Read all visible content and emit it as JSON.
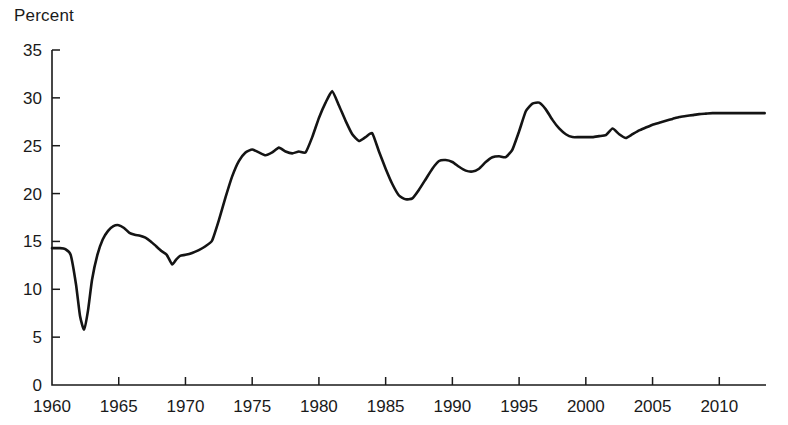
{
  "chart_data": {
    "type": "line",
    "title": "",
    "subtitle": "",
    "xlabel": "",
    "ylabel": "Percent",
    "ylim": [
      0,
      35
    ],
    "xlim": [
      1960,
      2013.5
    ],
    "yticks": [
      0,
      5,
      10,
      15,
      20,
      25,
      30,
      35
    ],
    "ytick_labels": [
      "0",
      "5",
      "10",
      "15",
      "20",
      "25",
      "30",
      "35"
    ],
    "xticks": [
      1960,
      1965,
      1970,
      1975,
      1980,
      1985,
      1990,
      1995,
      2000,
      2005,
      2010
    ],
    "xtick_labels": [
      "1960",
      "1965",
      "1970",
      "1975",
      "1980",
      "1985",
      "1990",
      "1995",
      "2000",
      "2005",
      "2010"
    ],
    "grid": false,
    "legend": false,
    "legend_position": "none",
    "line_color": "#141414",
    "background_color": "#ffffff",
    "series": [
      {
        "name": "Percent",
        "x": [
          1960.0,
          1960.6,
          1961.0,
          1961.4,
          1961.8,
          1962.1,
          1962.4,
          1962.7,
          1963.0,
          1963.4,
          1963.8,
          1964.2,
          1964.6,
          1965.0,
          1965.4,
          1965.8,
          1966.2,
          1966.6,
          1967.0,
          1967.4,
          1967.8,
          1968.2,
          1968.6,
          1969.0,
          1969.3,
          1969.6,
          1970.0,
          1970.5,
          1971.0,
          1971.5,
          1972.0,
          1972.5,
          1973.0,
          1973.5,
          1974.0,
          1974.5,
          1975.0,
          1975.5,
          1976.0,
          1976.5,
          1977.0,
          1977.5,
          1978.0,
          1978.5,
          1979.0,
          1979.5,
          1980.0,
          1980.5,
          1981.0,
          1981.5,
          1982.0,
          1982.5,
          1983.0,
          1983.5,
          1984.0,
          1984.5,
          1985.0,
          1985.5,
          1986.0,
          1986.5,
          1987.0,
          1987.5,
          1988.0,
          1988.5,
          1989.0,
          1989.5,
          1990.0,
          1990.5,
          1991.0,
          1991.5,
          1992.0,
          1992.5,
          1993.0,
          1993.5,
          1994.0,
          1994.5,
          1995.0,
          1995.5,
          1996.0,
          1996.5,
          1997.0,
          1997.5,
          1998.0,
          1998.5,
          1999.0,
          1999.5,
          2000.0,
          2000.5,
          2001.0,
          2001.5,
          2002.0,
          2002.5,
          2003.0,
          2003.5,
          2004.0,
          2004.5,
          2005.0,
          2005.5,
          2006.0,
          2006.5,
          2007.0,
          2007.5,
          2008.0,
          2008.5,
          2009.0,
          2009.5,
          2010.0,
          2010.5,
          2011.0,
          2011.5,
          2012.0,
          2012.5,
          2013.0,
          2013.4
        ],
        "values": [
          14.3,
          14.3,
          14.2,
          13.6,
          10.5,
          7.2,
          5.8,
          7.8,
          11.0,
          13.6,
          15.2,
          16.1,
          16.6,
          16.7,
          16.4,
          15.9,
          15.7,
          15.6,
          15.4,
          15.0,
          14.5,
          14.0,
          13.6,
          12.6,
          13.1,
          13.5,
          13.6,
          13.8,
          14.1,
          14.5,
          15.1,
          17.2,
          19.6,
          21.8,
          23.4,
          24.3,
          24.6,
          24.3,
          24.0,
          24.3,
          24.8,
          24.4,
          24.2,
          24.4,
          24.3,
          25.9,
          27.9,
          29.5,
          30.7,
          29.2,
          27.6,
          26.2,
          25.5,
          25.9,
          26.3,
          24.4,
          22.6,
          21.0,
          19.8,
          19.4,
          19.5,
          20.4,
          21.5,
          22.6,
          23.4,
          23.5,
          23.3,
          22.8,
          22.4,
          22.3,
          22.6,
          23.3,
          23.8,
          23.9,
          23.8,
          24.6,
          26.5,
          28.6,
          29.4,
          29.5,
          28.8,
          27.7,
          26.8,
          26.2,
          25.9,
          25.9,
          25.9,
          25.9,
          26.0,
          26.1,
          26.8,
          26.2,
          25.8,
          26.2,
          26.6,
          26.9,
          27.2,
          27.4,
          27.6,
          27.8,
          28.0,
          28.1,
          28.2,
          28.3,
          28.35,
          28.4,
          28.4,
          28.4,
          28.4,
          28.4,
          28.4,
          28.4,
          28.4,
          28.4
        ],
        "start_value": 14.3,
        "end_value": 28.4,
        "min_value": 5.8,
        "min_year": 1962.4,
        "max_value": 30.7,
        "max_year": 1981.0
      }
    ]
  }
}
